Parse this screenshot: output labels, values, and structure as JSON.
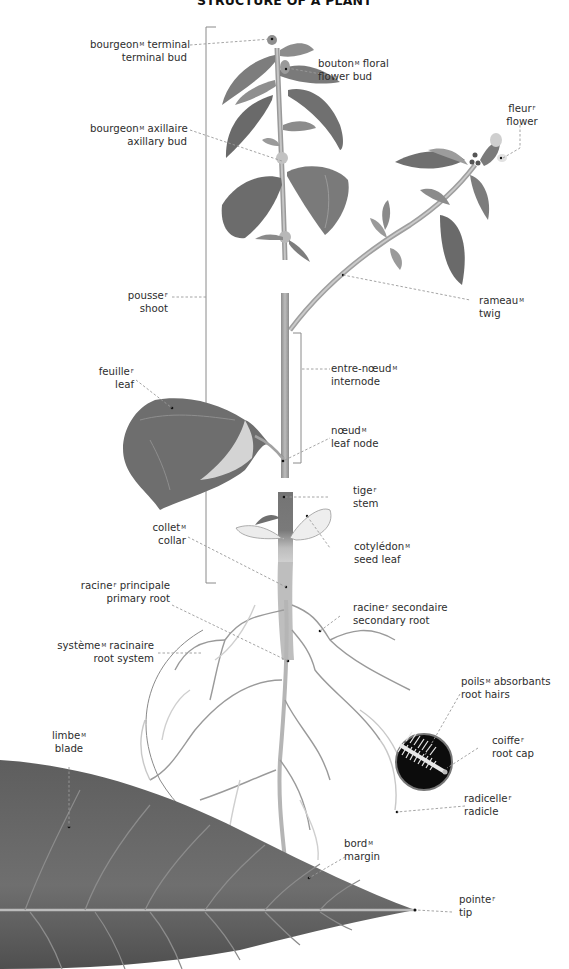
{
  "title": "STRUCTURE OF A PLANT",
  "labels": {
    "terminal_bud": {
      "fr": "bourgeon",
      "gender": "M",
      "fr_suffix": " terminal",
      "en": "terminal bud"
    },
    "flower_bud": {
      "fr": "bouton",
      "gender": "M",
      "fr_suffix": " floral",
      "en": "flower bud"
    },
    "axillary_bud": {
      "fr": "bourgeon",
      "gender": "M",
      "fr_suffix": " axillaire",
      "en": "axillary bud"
    },
    "flower": {
      "fr": "fleur",
      "gender": "F",
      "fr_suffix": "",
      "en": "flower"
    },
    "shoot": {
      "fr": "pousse",
      "gender": "F",
      "fr_suffix": "",
      "en": "shoot"
    },
    "twig": {
      "fr": "rameau",
      "gender": "M",
      "fr_suffix": "",
      "en": "twig"
    },
    "leaf": {
      "fr": "feuille",
      "gender": "F",
      "fr_suffix": "",
      "en": "leaf"
    },
    "internode": {
      "fr": "entre-nœud",
      "gender": "M",
      "fr_suffix": "",
      "en": "internode"
    },
    "leaf_node": {
      "fr": "nœud",
      "gender": "M",
      "fr_suffix": "",
      "en": "leaf node"
    },
    "stem": {
      "fr": "tige",
      "gender": "F",
      "fr_suffix": "",
      "en": "stem"
    },
    "collar": {
      "fr": "collet",
      "gender": "M",
      "fr_suffix": "",
      "en": "collar"
    },
    "seed_leaf": {
      "fr": "cotylédon",
      "gender": "M",
      "fr_suffix": "",
      "en": "seed leaf"
    },
    "primary_root": {
      "fr": "racine",
      "gender": "F",
      "fr_suffix": " principale",
      "en": "primary root"
    },
    "secondary_root": {
      "fr": "racine",
      "gender": "F",
      "fr_suffix": " secondaire",
      "en": "secondary root"
    },
    "root_system": {
      "fr": "système",
      "gender": "M",
      "fr_suffix": " racinaire",
      "en": "root system"
    },
    "root_hairs": {
      "fr": "poils",
      "gender": "M",
      "fr_suffix": " absorbants",
      "en": "root hairs"
    },
    "blade": {
      "fr": "limbe",
      "gender": "M",
      "fr_suffix": "",
      "en": "blade"
    },
    "root_cap": {
      "fr": "coiffe",
      "gender": "F",
      "fr_suffix": "",
      "en": "root cap"
    },
    "radicle": {
      "fr": "radicelle",
      "gender": "F",
      "fr_suffix": "",
      "en": "radicle"
    },
    "margin": {
      "fr": "bord",
      "gender": "M",
      "fr_suffix": "",
      "en": "margin"
    },
    "tip": {
      "fr": "pointe",
      "gender": "F",
      "fr_suffix": "",
      "en": "tip"
    }
  },
  "colors": {
    "leaf_dark": "#6e6e6e",
    "leaf_mid": "#8a8a8a",
    "leaf_light": "#c9c9c9",
    "stem": "#a8a8a8",
    "leader_line": "#9a9a9a",
    "text": "#2d2d2d"
  }
}
